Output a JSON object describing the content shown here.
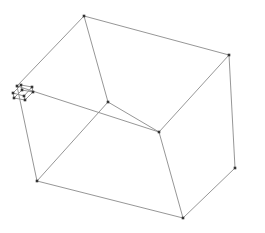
{
  "diagram": {
    "type": "wireframe-cube",
    "background": "#ffffff",
    "edge_color": "#8a8a8a",
    "vertex_color": "#333333",
    "large_cube": {
      "vertices": [
        [
          84,
          16
        ],
        [
          229,
          55
        ],
        [
          37,
          181
        ],
        [
          183,
          218
        ],
        [
          108,
          102
        ],
        [
          159,
          132
        ],
        [
          17,
          86
        ],
        [
          235,
          168
        ]
      ],
      "edges": [
        [
          0,
          1
        ],
        [
          0,
          4
        ],
        [
          1,
          7
        ],
        [
          1,
          5
        ],
        [
          4,
          2
        ],
        [
          2,
          3
        ],
        [
          3,
          7
        ],
        [
          4,
          5
        ],
        [
          5,
          3
        ],
        [
          6,
          0
        ],
        [
          6,
          2
        ],
        [
          6,
          5
        ]
      ]
    },
    "small_cube": {
      "vertices": [
        [
          21,
          85
        ],
        [
          32,
          87
        ],
        [
          13,
          93
        ],
        [
          24,
          96
        ],
        [
          22,
          90
        ],
        [
          33,
          92
        ],
        [
          14,
          98
        ],
        [
          25,
          100
        ]
      ],
      "edges": [
        [
          0,
          1
        ],
        [
          0,
          2
        ],
        [
          1,
          3
        ],
        [
          2,
          3
        ],
        [
          4,
          5
        ],
        [
          4,
          6
        ],
        [
          5,
          7
        ],
        [
          6,
          7
        ],
        [
          0,
          4
        ],
        [
          1,
          5
        ],
        [
          2,
          6
        ],
        [
          3,
          7
        ]
      ]
    }
  }
}
